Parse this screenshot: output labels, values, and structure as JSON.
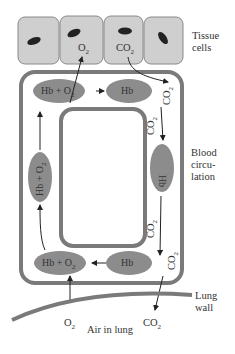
{
  "diagram": {
    "labels": {
      "tissue_cells": [
        "Tissue",
        "cells"
      ],
      "blood_circulation": [
        "Blood",
        "circu-",
        "lation"
      ],
      "lung_wall": [
        "Lung",
        "wall"
      ],
      "air_in_lung": "Air in lung"
    },
    "molecules": {
      "o2_tissue": "O",
      "co2_tissue": "CO",
      "co2_right_top": "CO",
      "co2_right_mid": "CO",
      "co2_right_lower": "CO",
      "co2_right_bottom": "CO",
      "o2_lung": "O",
      "co2_lung": "CO",
      "subscript": "2"
    },
    "nodes": {
      "top_left": "Hb + O",
      "top_right": "Hb",
      "right": "Hb",
      "bottom_right": "Hb",
      "bottom_left": "Hb + O",
      "left": "Hb + O"
    },
    "colors": {
      "cell_fill": "#cfcfcf",
      "cell_stroke": "#8a8a8a",
      "nucleus": "#222222",
      "vessel": "#7a7a7a",
      "node_fill": "#8c8c8c",
      "arrow": "#222222"
    }
  }
}
